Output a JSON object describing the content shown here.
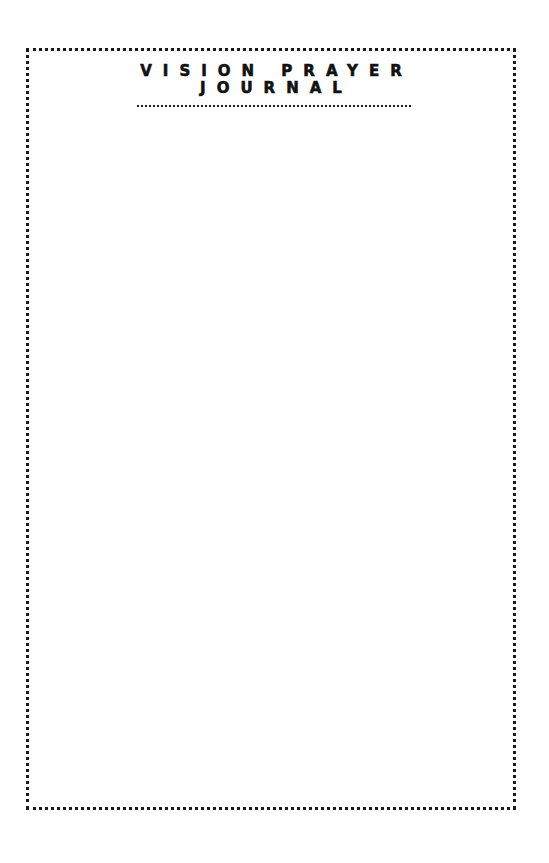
{
  "document": {
    "title_lines": [
      "VISION PRAYER",
      "JOURNAL"
    ],
    "colors": {
      "ink": "#111111",
      "paper": "#ffffff"
    },
    "border_style": "dotted",
    "body_content": ""
  }
}
